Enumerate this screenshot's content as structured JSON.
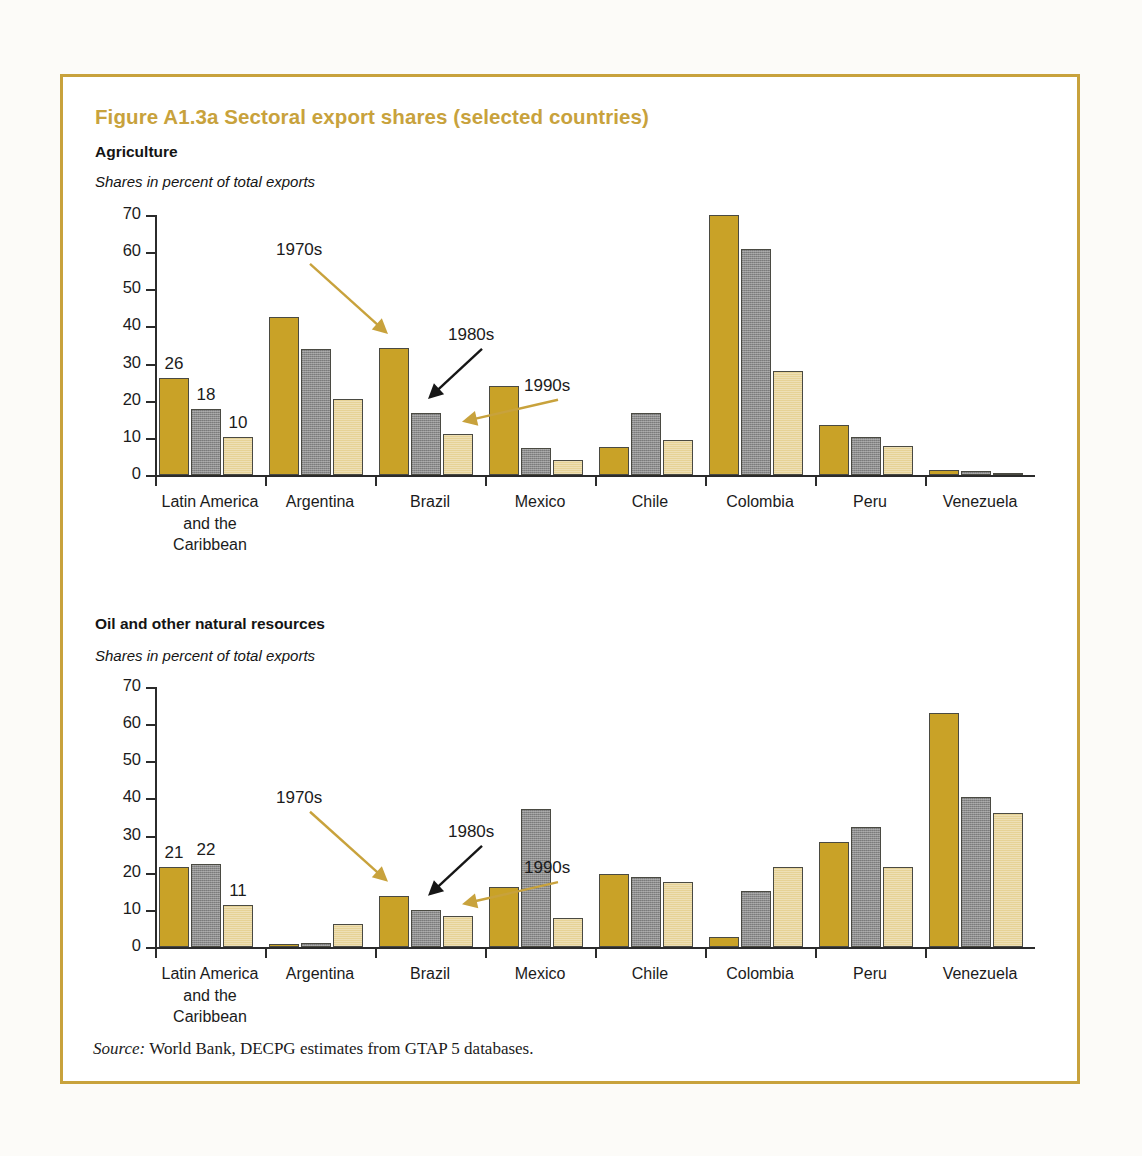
{
  "figure": {
    "title": "Figure A1.3a  Sectoral export shares (selected countries)",
    "source_prefix": "Source:",
    "source_text": " World Bank, DECPG estimates from GTAP 5 databases.",
    "border_color": "#c8a23c",
    "title_color": "#c8a23c"
  },
  "panels": [
    {
      "heading": "Agriculture",
      "subtitle": "Shares in percent of total exports",
      "value_labels": [
        {
          "text": "26",
          "series": 0,
          "category": 0
        },
        {
          "text": "18",
          "series": 1,
          "category": 0
        },
        {
          "text": "10",
          "series": 2,
          "category": 0
        }
      ],
      "annotations": [
        {
          "label": "1970s",
          "color": "#c8a23c",
          "target_series": 0,
          "target_category": 2
        },
        {
          "label": "1980s",
          "color": "#161616",
          "target_series": 1,
          "target_category": 2
        },
        {
          "label": "1990s",
          "color": "#c8a23c",
          "target_series": 2,
          "target_category": 2
        }
      ]
    },
    {
      "heading": "Oil and other natural resources",
      "subtitle": "Shares in percent of total exports",
      "value_labels": [
        {
          "text": "21",
          "series": 0,
          "category": 0
        },
        {
          "text": "22",
          "series": 1,
          "category": 0
        },
        {
          "text": "11",
          "series": 2,
          "category": 0
        }
      ],
      "annotations": [
        {
          "label": "1970s",
          "color": "#c8a23c",
          "target_series": 0,
          "target_category": 2
        },
        {
          "label": "1980s",
          "color": "#161616",
          "target_series": 1,
          "target_category": 2
        },
        {
          "label": "1990s",
          "color": "#c8a23c",
          "target_series": 2,
          "target_category": 2
        }
      ]
    }
  ],
  "chart_data": [
    {
      "type": "bar",
      "title": "Agriculture",
      "subtitle": "Shares in percent of total exports",
      "xlabel": "",
      "ylabel": "",
      "ylim": [
        0,
        70
      ],
      "yticks": [
        0,
        10,
        20,
        30,
        40,
        50,
        60,
        70
      ],
      "grid": false,
      "legend": "annotated arrows (1970s, 1980s, 1990s)",
      "categories": [
        "Latin America and the Caribbean",
        "Argentina",
        "Brazil",
        "Mexico",
        "Chile",
        "Colombia",
        "Peru",
        "Venezuela"
      ],
      "category_lines": [
        [
          "Latin America",
          "and the",
          "Caribbean"
        ],
        [
          "Argentina"
        ],
        [
          "Brazil"
        ],
        [
          "Mexico"
        ],
        [
          "Chile"
        ],
        [
          "Colombia"
        ],
        [
          "Peru"
        ],
        [
          "Venezuela"
        ]
      ],
      "series": [
        {
          "name": "1970s",
          "color": "#c9a227",
          "values": [
            26.0,
            42.5,
            34.2,
            23.9,
            7.6,
            70.0,
            13.4,
            1.3
          ]
        },
        {
          "name": "1980s",
          "color": "#8c8c8c",
          "values": [
            17.9,
            33.8,
            16.7,
            7.4,
            16.8,
            60.8,
            10.2,
            1.1
          ]
        },
        {
          "name": "1990s",
          "color": "#e6d296",
          "values": [
            10.2,
            20.5,
            11.1,
            4.1,
            9.3,
            27.9,
            7.8,
            0.6
          ]
        }
      ]
    },
    {
      "type": "bar",
      "title": "Oil and other natural resources",
      "subtitle": "Shares in percent of total exports",
      "xlabel": "",
      "ylabel": "",
      "ylim": [
        0,
        70
      ],
      "yticks": [
        0,
        10,
        20,
        30,
        40,
        50,
        60,
        70
      ],
      "grid": false,
      "legend": "annotated arrows (1970s, 1980s, 1990s)",
      "categories": [
        "Latin America and the Caribbean",
        "Argentina",
        "Brazil",
        "Mexico",
        "Chile",
        "Colombia",
        "Peru",
        "Venezuela"
      ],
      "category_lines": [
        [
          "Latin America",
          "and the",
          "Caribbean"
        ],
        [
          "Argentina"
        ],
        [
          "Brazil"
        ],
        [
          "Mexico"
        ],
        [
          "Chile"
        ],
        [
          "Colombia"
        ],
        [
          "Peru"
        ],
        [
          "Venezuela"
        ]
      ],
      "series": [
        {
          "name": "1970s",
          "color": "#c9a227",
          "values": [
            21.6,
            0.7,
            13.8,
            16.1,
            19.7,
            2.7,
            28.3,
            63.0
          ]
        },
        {
          "name": "1980s",
          "color": "#8c8c8c",
          "values": [
            22.3,
            1.2,
            10.0,
            37.1,
            18.9,
            15.2,
            32.3,
            40.3
          ]
        },
        {
          "name": "1990s",
          "color": "#e6d296",
          "values": [
            11.4,
            6.2,
            8.3,
            7.7,
            17.4,
            21.5,
            21.5,
            36.0
          ]
        }
      ]
    }
  ]
}
